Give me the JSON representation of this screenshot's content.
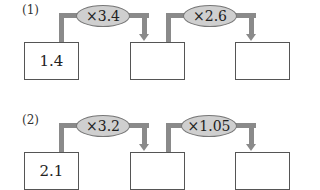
{
  "problems": [
    {
      "label": "(1)",
      "start_value": "1.4",
      "operations": [
        "×3.4",
        "×2.6"
      ],
      "answers": [
        "",
        ""
      ]
    },
    {
      "label": "(2)",
      "start_value": "2.1",
      "operations": [
        "×3.2",
        "×1.05"
      ],
      "answers": [
        "",
        ""
      ]
    }
  ],
  "colors": {
    "pipe": "#8a8a8a",
    "ellipse_fill": "#cfcfcf",
    "box_border": "#555555"
  }
}
